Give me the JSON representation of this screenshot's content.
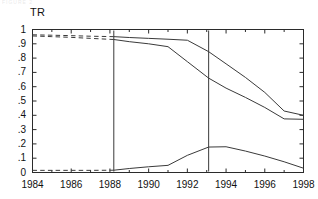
{
  "figure": {
    "ghost_text_top": "FIGURE 2",
    "axis_title": "TR",
    "background": "#ffffff",
    "line_color": "#3a3a3a",
    "frame_color": "#2b2b2b"
  },
  "chart_data": {
    "type": "line",
    "title": "",
    "subtitle": "",
    "xlabel": "",
    "ylabel": "TR",
    "xlim": [
      1984,
      1998
    ],
    "ylim": [
      0,
      1
    ],
    "grid": false,
    "legend": "none",
    "xticks": [
      1984,
      1986,
      1988,
      1990,
      1992,
      1994,
      1996,
      1998
    ],
    "xtick_labels": [
      "1984",
      "1986",
      "1988",
      "1990",
      "1992",
      "1994",
      "1996",
      "1998"
    ],
    "xminor_ticks": [
      1985,
      1987,
      1989,
      1991,
      1993,
      1995,
      1997
    ],
    "yticks": [
      0,
      0.1,
      0.2,
      0.3,
      0.4,
      0.5,
      0.6,
      0.7,
      0.8,
      0.9,
      1
    ],
    "ytick_labels": [
      "0",
      ".1",
      ".2",
      ".3",
      ".4",
      ".5",
      ".6",
      ".7",
      ".8",
      ".9",
      "1"
    ],
    "vertical_reference_lines": [
      1988.2,
      1993.1
    ],
    "series": [
      {
        "name": "upper",
        "dashed_until": 1988.2,
        "x": [
          1984,
          1985,
          1986,
          1987,
          1988.2,
          1989,
          1990,
          1991,
          1992,
          1993.1,
          1994,
          1995,
          1996,
          1997,
          1998
        ],
        "values": [
          0.963,
          0.96,
          0.957,
          0.953,
          0.95,
          0.944,
          0.938,
          0.932,
          0.925,
          0.845,
          0.76,
          0.665,
          0.56,
          0.43,
          0.4
        ]
      },
      {
        "name": "middle",
        "dashed_until": 1988.2,
        "x": [
          1984,
          1985,
          1986,
          1987,
          1988.2,
          1989,
          1990,
          1991,
          1992,
          1993.1,
          1994,
          1995,
          1996,
          1997,
          1998
        ],
        "values": [
          0.955,
          0.95,
          0.945,
          0.938,
          0.93,
          0.915,
          0.9,
          0.88,
          0.775,
          0.66,
          0.59,
          0.525,
          0.455,
          0.375,
          0.372
        ]
      },
      {
        "name": "lower",
        "dashed_until": 1988.2,
        "x": [
          1984,
          1985,
          1986,
          1987,
          1988.2,
          1989,
          1990,
          1991,
          1992,
          1993.1,
          1994,
          1995,
          1996,
          1997,
          1998
        ],
        "values": [
          0.015,
          0.015,
          0.015,
          0.015,
          0.016,
          0.028,
          0.04,
          0.05,
          0.12,
          0.178,
          0.18,
          0.15,
          0.115,
          0.075,
          0.03
        ]
      }
    ]
  }
}
